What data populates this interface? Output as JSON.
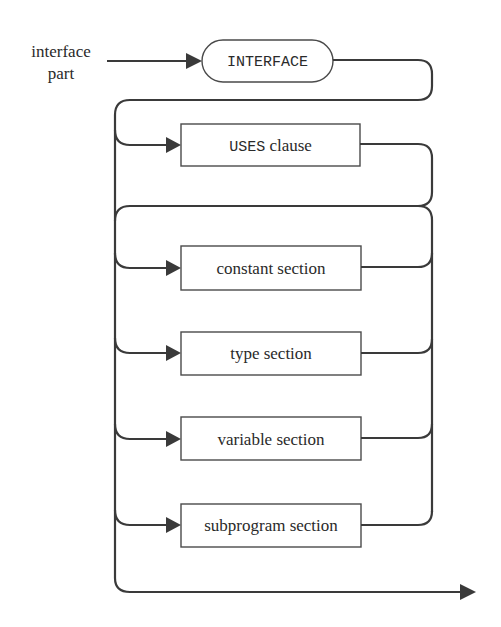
{
  "diagram": {
    "type": "syntax-diagram",
    "entry_label_line1": "interface",
    "entry_label_line2": "part",
    "keyword": "INTERFACE",
    "uses_clause": {
      "keyword": "USES",
      "suffix": " clause"
    },
    "sections": [
      {
        "label": "constant section"
      },
      {
        "label": "type section"
      },
      {
        "label": "variable section"
      },
      {
        "label": "subprogram section"
      }
    ],
    "colors": {
      "line": "#3a3a3a",
      "box_border": "#4a4a4a",
      "text": "#2a2a2a",
      "background": "#ffffff"
    }
  }
}
